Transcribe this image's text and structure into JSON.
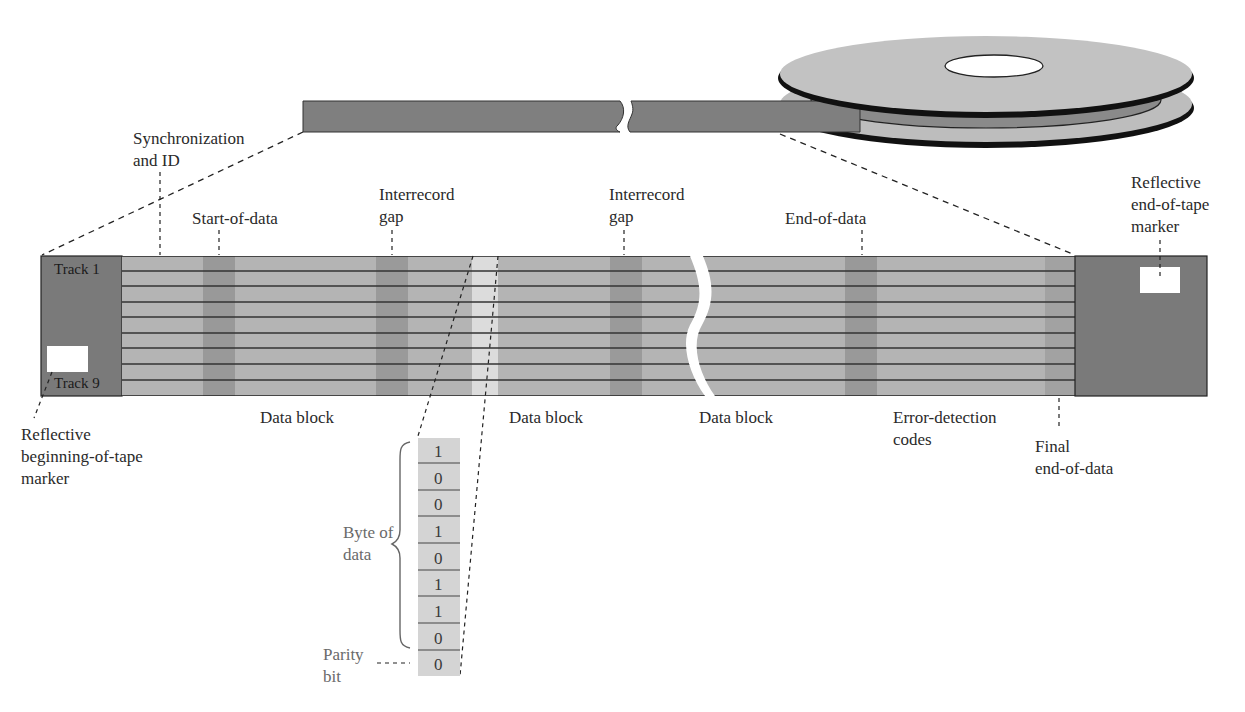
{
  "diagram": {
    "colors": {
      "tape_dark": "#7a7a7a",
      "tape_body": "#b4b4b4",
      "gap_band": "#999999",
      "light_band": "#dcdcdc",
      "marker": "#ffffff",
      "reel_face": "#bdbdbd",
      "reel_dark": "#8a8a8a"
    },
    "labels": {
      "sync_id": [
        "Synchronization",
        "and ID"
      ],
      "start_of_data": "Start-of-data",
      "gap1": [
        "Interrecord",
        "gap"
      ],
      "gap2": [
        "Interrecord",
        "gap"
      ],
      "end_of_data": "End-of-data",
      "eot_marker": [
        "Reflective",
        "end-of-tape",
        "marker"
      ],
      "bot_marker": [
        "Reflective",
        "beginning-of-tape",
        "marker"
      ],
      "data_block_1": "Data block",
      "data_block_2": "Data block",
      "data_block_3": "Data block",
      "error_codes": [
        "Error-detection",
        "codes"
      ],
      "final_end": [
        "Final",
        "end-of-data"
      ],
      "byte_of_data": [
        "Byte of",
        "data"
      ],
      "parity": [
        "Parity",
        "bit"
      ]
    },
    "tracks": {
      "first": "Track 1",
      "last": "Track 9",
      "count": 9
    },
    "byte_bits": [
      "1",
      "0",
      "0",
      "1",
      "0",
      "1",
      "1",
      "0"
    ],
    "parity_bit": "0"
  }
}
